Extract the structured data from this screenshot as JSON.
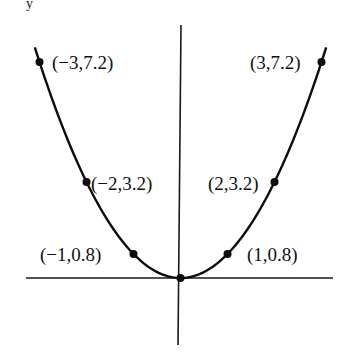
{
  "chart_data": {
    "type": "line",
    "title": "",
    "function": "y = 0.8x^2",
    "xlabel": "",
    "ylabel": "y",
    "grid": false,
    "legend": null,
    "xlim": [
      -3.3,
      3.25
    ],
    "ylim": [
      -2.2,
      8.4
    ],
    "series": [
      {
        "name": "parabola",
        "x": [
          -3.1,
          -3,
          -2,
          -1,
          0,
          1,
          2,
          3,
          3.1
        ],
        "y": [
          7.69,
          7.2,
          3.2,
          0.8,
          0,
          0.8,
          3.2,
          7.2,
          7.69
        ]
      }
    ],
    "points": [
      {
        "x": -3,
        "y": 7.2,
        "label": "(−3,7.2)"
      },
      {
        "x": -2,
        "y": 3.2,
        "label": "(−2,3.2)"
      },
      {
        "x": -1,
        "y": 0.8,
        "label": "(−1,0.8)"
      },
      {
        "x": 0,
        "y": 0,
        "label": ""
      },
      {
        "x": 1,
        "y": 0.8,
        "label": "(1,0.8)"
      },
      {
        "x": 2,
        "y": 3.2,
        "label": "(2,3.2)"
      },
      {
        "x": 3,
        "y": 7.2,
        "label": "(3,7.2)"
      }
    ]
  },
  "labels": {
    "p_m3": "(−3,7.2)",
    "p_m2": "(−2,3.2)",
    "p_m1": "(−1,0.8)",
    "p_1": "(1,0.8)",
    "p_2": "(2,3.2)",
    "p_3": "(3,7.2)",
    "y_axis_fragment": "y"
  },
  "colors": {
    "ink": "#0d0d0d",
    "background": "#ffffff"
  }
}
